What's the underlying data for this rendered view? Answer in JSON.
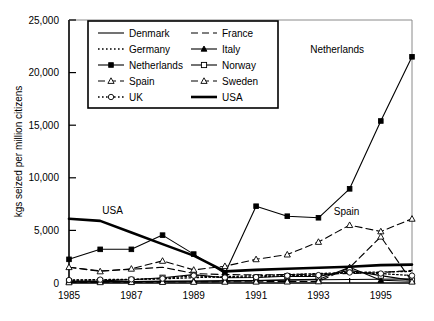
{
  "chart_data": {
    "type": "line",
    "title": "",
    "xlabel": "",
    "ylabel": "kgs seized per million citizens",
    "xlim": [
      1985,
      1996
    ],
    "ylim": [
      0,
      25000
    ],
    "grid": false,
    "legend_position": "top-left-inside",
    "x": [
      1985,
      1986,
      1987,
      1988,
      1989,
      1990,
      1991,
      1992,
      1993,
      1994,
      1995,
      1996
    ],
    "xtick_labels": [
      "1985",
      "1987",
      "1989",
      "1991",
      "1993",
      "1995"
    ],
    "xtick_values": [
      1985,
      1987,
      1989,
      1991,
      1993,
      1995
    ],
    "ytick_labels": [
      "0",
      "5,000",
      "10,000",
      "15,000",
      "20,000",
      "25,000"
    ],
    "ytick_values": [
      0,
      5000,
      10000,
      15000,
      20000,
      25000
    ],
    "annotations": [
      {
        "text": "USA",
        "x": 1986.4,
        "y": 6550
      },
      {
        "text": "Netherlands",
        "x": 1993.6,
        "y": 21900
      },
      {
        "text": "Spain",
        "x": 1993.9,
        "y": 6450
      }
    ],
    "series": [
      {
        "name": "Denmark",
        "style": "solid",
        "marker": "none",
        "values": [
          90,
          110,
          130,
          150,
          170,
          200,
          230,
          260,
          300,
          330,
          360,
          390
        ]
      },
      {
        "name": "France",
        "style": "dashed",
        "marker": "none",
        "values": [
          1500,
          1150,
          1300,
          1500,
          900,
          800,
          780,
          800,
          850,
          900,
          1000,
          1200
        ]
      },
      {
        "name": "Germany",
        "style": "dotted",
        "marker": "none",
        "values": [
          260,
          300,
          330,
          400,
          500,
          600,
          700,
          800,
          900,
          1000,
          1050,
          1100
        ]
      },
      {
        "name": "Italy",
        "style": "solid",
        "marker": "triangle-filled",
        "values": [
          120,
          130,
          140,
          160,
          180,
          200,
          240,
          300,
          340,
          1500,
          260,
          160
        ]
      },
      {
        "name": "Netherlands",
        "style": "solid",
        "marker": "square-filled",
        "values": [
          2250,
          3200,
          3200,
          4550,
          2750,
          900,
          7300,
          6350,
          6200,
          8950,
          15400,
          21500
        ]
      },
      {
        "name": "Norway",
        "style": "solid",
        "marker": "square-open",
        "values": [
          160,
          200,
          300,
          500,
          800,
          500,
          520,
          650,
          620,
          1200,
          700,
          250
        ]
      },
      {
        "name": "Spain",
        "style": "dashed",
        "marker": "triangle-open",
        "values": [
          1500,
          1100,
          1350,
          2100,
          1250,
          1600,
          2250,
          2700,
          3900,
          5500,
          4900,
          6100
        ]
      },
      {
        "name": "Sweden",
        "style": "dashed",
        "marker": "triangle-open",
        "values": [
          60,
          70,
          80,
          90,
          100,
          110,
          120,
          130,
          150,
          1450,
          4400,
          120
        ]
      },
      {
        "name": "UK",
        "style": "dotted",
        "marker": "circle-open",
        "values": [
          280,
          320,
          350,
          420,
          700,
          520,
          560,
          700,
          750,
          1000,
          900,
          700
        ]
      },
      {
        "name": "USA",
        "style": "thick-solid",
        "marker": "none",
        "values": [
          6100,
          5900,
          4800,
          3700,
          2600,
          1100,
          1250,
          1350,
          1450,
          1550,
          1700,
          1750
        ]
      }
    ]
  },
  "legend": {
    "column_left": [
      "Denmark",
      "Germany",
      "Netherlands",
      "Spain",
      "UK"
    ],
    "column_right": [
      "France",
      "Italy",
      "Norway",
      "Sweden",
      "USA"
    ]
  },
  "colors": {
    "foreground": "#000000",
    "background": "#ffffff"
  }
}
